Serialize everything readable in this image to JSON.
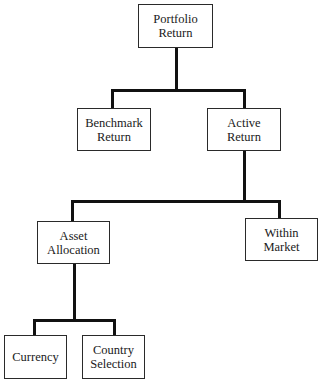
{
  "diagram": {
    "type": "tree",
    "nodes": {
      "portfolio_return": {
        "line1": "Portfolio",
        "line2": "Return"
      },
      "benchmark_return": {
        "line1": "Benchmark",
        "line2": "Return"
      },
      "active_return": {
        "line1": "Active",
        "line2": "Return"
      },
      "asset_allocation": {
        "line1": "Asset",
        "line2": "Allocation"
      },
      "within_market": {
        "line1": "Within",
        "line2": "Market"
      },
      "currency": {
        "line1": "Currency"
      },
      "country_selection": {
        "line1": "Country",
        "line2": "Selection"
      }
    },
    "edges": [
      [
        "Portfolio Return",
        "Benchmark Return"
      ],
      [
        "Portfolio Return",
        "Active Return"
      ],
      [
        "Active Return",
        "Asset Allocation"
      ],
      [
        "Active Return",
        "Within Market"
      ],
      [
        "Asset Allocation",
        "Currency"
      ],
      [
        "Asset Allocation",
        "Country Selection"
      ]
    ]
  }
}
